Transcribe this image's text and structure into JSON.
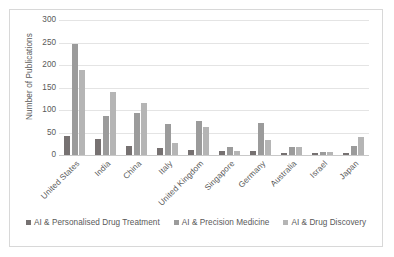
{
  "chart_data": {
    "type": "bar",
    "title": "",
    "xlabel": "",
    "ylabel": "Number of Publications",
    "ylim": [
      0,
      300
    ],
    "yticks": [
      0,
      50,
      100,
      150,
      200,
      250,
      300
    ],
    "grid": true,
    "legend_position": "bottom",
    "categories": [
      "United States",
      "India",
      "China",
      "Italy",
      "United Kingdom",
      "Singapore",
      "Germany",
      "Australia",
      "Israel",
      "Japan"
    ],
    "series": [
      {
        "name": "AI & Personalised Drug Treatment",
        "color": "#767171",
        "values": [
          42,
          35,
          21,
          15,
          12,
          9,
          8,
          5,
          5,
          5
        ]
      },
      {
        "name": "AI & Precision Medicine",
        "color": "#9b9b9b",
        "values": [
          247,
          86,
          94,
          69,
          76,
          17,
          71,
          18,
          6,
          21
        ]
      },
      {
        "name": "AI & Drug Discovery",
        "color": "#b5b5b5",
        "values": [
          188,
          141,
          115,
          26,
          63,
          9,
          34,
          17,
          6,
          41
        ]
      }
    ]
  }
}
